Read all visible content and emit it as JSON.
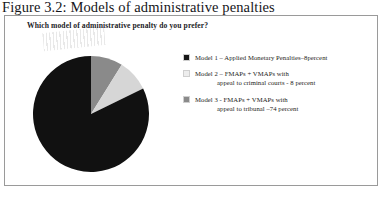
{
  "figure": {
    "caption": "Figure 3.2: Models of administrative penalties",
    "question": "Which model of administrative penalty do you prefer?"
  },
  "legend": {
    "items": [
      {
        "label_line1": "Model 1 –  Applied  Monetary Penalties–8percent",
        "label_line2": "",
        "swatch_color": "#171717"
      },
      {
        "label_line1": "Model 2 –  FMAPs + VMAPs with",
        "label_line2": "appeal to criminal courts - 8 percent",
        "swatch_color": "#ededed"
      },
      {
        "label_line1": "Model 3 -  FMAPs + VMAPs  with",
        "label_line2": "appeal to tribunal –74 percent",
        "swatch_color": "#8a8a8a"
      }
    ]
  },
  "chart_data": {
    "type": "pie",
    "title": "Which model of administrative penalty do you prefer?",
    "categories": [
      "Model 1 – Applied Monetary Penalties",
      "Model 2 – FMAPs + VMAPs with appeal to criminal courts",
      "Model 3 – FMAPs + VMAPs with appeal to tribunal"
    ],
    "values": [
      8,
      8,
      74
    ],
    "value_unit": "percent",
    "colors": [
      "#8a8a8a",
      "#d6d6d6",
      "#111111"
    ],
    "legend_position": "right",
    "grid": false,
    "start_angle_deg": 0,
    "direction": "clockwise",
    "note": "Slices shown clockwise from 12 o'clock: Model 1 (8%) mid-grey, Model 2 (8%) light grey, Model 3 (74%) black. Remaining 10% unlabelled in source figure."
  }
}
